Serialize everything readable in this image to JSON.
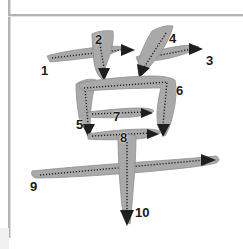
{
  "page": {
    "character": "革",
    "stroke_count": 10,
    "background_color": "#ffffff",
    "stroke_color": "#a9a9a9",
    "stroke_outline_color": "#8f8f8f",
    "guide_color": "#1f1f1f",
    "number_color": "#1a1a1a",
    "border_color": "#b4b4b4"
  },
  "borders": {
    "vertical_rule": "vertical-rule",
    "horizontal_rule": "horizontal-rule",
    "corner_swatch": "corner-swatch"
  },
  "strokes": [
    {
      "number": "1",
      "label_x": 41,
      "label_y": 64,
      "direction": "left-to-right",
      "type": "horizontal",
      "body": "M 47 56 C 60 52 80 49 100 47 C 110 46 118 46 124 47 C 118 52 108 55 96 57 C 80 59 62 61 50 62 Z",
      "guide": "M 52 58 L 121 50",
      "arrow": "M 121 44 L 135 50 L 121 56 Z",
      "arrow_tip_x": 135,
      "arrow_tip_y": 50
    },
    {
      "number": "2",
      "label_x": 95,
      "label_y": 33,
      "direction": "top-to-bottom",
      "type": "vertical-curved",
      "body": "M 92 34 C 98 31 106 30 113 31 C 114 40 112 50 108 60 C 105 68 103 74 102 79 C 98 76 95 70 94 62 C 93 52 92 42 92 34 Z",
      "guide": "M 99 38 L 104 68",
      "arrow": "M 98 68 L 110 68 L 104 81 Z",
      "arrow_tip_x": 104,
      "arrow_tip_y": 81
    },
    {
      "number": "3",
      "label_x": 206,
      "label_y": 54,
      "direction": "left-to-right",
      "type": "horizontal",
      "body": "M 136 57 C 150 52 166 48 180 46 C 188 45 194 45 199 47 C 192 52 182 55 170 58 C 156 61 144 62 138 62 Z",
      "guide": "M 140 59 L 192 49",
      "arrow": "M 189 43 L 203 49 L 189 55 Z",
      "arrow_tip_x": 203,
      "arrow_tip_y": 49
    },
    {
      "number": "4",
      "label_x": 169,
      "label_y": 32,
      "direction": "top-right-to-bottom-left",
      "type": "diagonal",
      "body": "M 152 31 C 159 27 167 25 173 26 C 171 35 166 45 159 55 C 152 64 146 71 141 76 C 138 72 137 66 139 59 C 142 49 147 39 152 31 Z",
      "guide": "M 166 33 L 143 69",
      "arrow": "M 150 68 L 139 78 L 137 64 Z",
      "arrow_tip_x": 139,
      "arrow_tip_y": 78
    },
    {
      "number": "5",
      "label_x": 76,
      "label_y": 118,
      "direction": "top-to-bottom-left",
      "type": "vertical",
      "body": "M 76 84 C 82 80 90 78 96 80 C 94 88 92 98 91 108 C 90 118 90 126 91 133 C 86 132 81 126 79 117 C 77 106 76 94 76 84 Z",
      "guide": "M 85 88 L 88 124",
      "arrow": "M 82 124 L 95 124 L 88 137 Z",
      "arrow_tip_x": 88,
      "arrow_tip_y": 137
    },
    {
      "number": "6",
      "label_x": 176,
      "label_y": 84,
      "direction": "left-to-right-then-down",
      "type": "horizontal-vertical",
      "body": "M 79 83 C 100 79 130 76 152 76 C 162 76 170 77 175 80 C 177 90 176 102 173 114 C 171 124 168 131 165 136 C 160 133 157 126 157 116 C 157 106 159 95 161 88 C 140 88 110 89 88 91 C 82 91 79 88 79 83 Z",
      "guide": "M 84 88 L 167 82 L 163 125",
      "arrow": "M 157 124 L 170 124 L 163 137 Z",
      "arrow_tip_x": 163,
      "arrow_tip_y": 137
    },
    {
      "number": "7",
      "label_x": 113,
      "label_y": 110,
      "direction": "left-to-right",
      "type": "horizontal",
      "body": "M 88 112 C 105 110 125 108 140 108 C 147 108 152 109 154 111 C 150 114 142 116 132 117 C 116 118 98 118 88 117 Z",
      "guide": "M 92 114 L 144 112",
      "arrow": "M 141 108 L 153 113 L 141 118 Z",
      "arrow_tip_x": 153,
      "arrow_tip_y": 113
    },
    {
      "number": "8",
      "label_x": 120,
      "label_y": 131,
      "direction": "left-to-right",
      "type": "horizontal",
      "body": "M 88 134 C 106 131 128 129 145 129 C 153 129 159 130 161 132 C 157 136 148 138 137 139 C 118 140 98 140 88 139 Z",
      "guide": "M 92 136 L 150 133",
      "arrow": "M 147 129 L 159 134 L 147 139 Z",
      "arrow_tip_x": 159,
      "arrow_tip_y": 134
    },
    {
      "number": "9",
      "label_x": 30,
      "label_y": 180,
      "direction": "left-to-right",
      "type": "long-horizontal",
      "body": "M 32 171 C 60 168 110 164 155 161 C 185 159 205 157 216 156 C 220 158 220 161 216 163 C 205 166 185 168 155 171 C 110 175 60 178 36 178 C 32 177 31 174 32 171 Z",
      "guide": "M 40 175 L 205 160",
      "arrow": "M 201 154 L 216 160 L 201 166 Z",
      "arrow_tip_x": 216,
      "arrow_tip_y": 160
    },
    {
      "number": "10",
      "label_x": 135,
      "label_y": 206,
      "direction": "top-to-bottom",
      "type": "long-vertical",
      "body": "M 118 136 C 124 134 131 134 136 136 C 136 150 135 170 133 192 C 132 205 131 216 130 224 C 125 222 122 212 121 196 C 119 175 118 152 118 136 Z",
      "guide": "M 127 142 L 127 212",
      "arrow": "M 120 210 L 134 210 L 127 226 Z",
      "arrow_tip_x": 127,
      "arrow_tip_y": 226
    }
  ]
}
